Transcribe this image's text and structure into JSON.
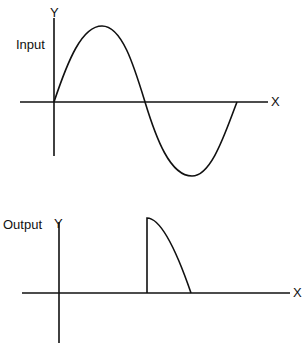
{
  "input_panel": {
    "label": "Input",
    "y_axis_label": "Y",
    "x_axis_label": "X",
    "waveform": "one full sine cycle (positive half then negative half)"
  },
  "output_panel": {
    "label": "Output",
    "y_axis_label": "Y",
    "x_axis_label": "X",
    "waveform": "clipped pulse: abrupt rise at zero crossing then decaying curve to baseline"
  },
  "colors": {
    "line": "#111111",
    "background": "#ffffff"
  }
}
